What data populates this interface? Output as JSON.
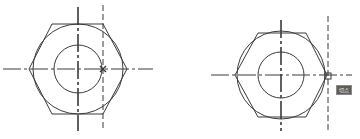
{
  "colors": {
    "line": "#3a3a3a",
    "background": "#ffffff",
    "tooltip_bg": "#5c5c5c"
  },
  "views": [
    {
      "id": "left",
      "center": [
        78,
        69
      ],
      "hexagon_points": "29,69 52,24 103,24 127,69 103,114 52,114",
      "outer_circle_r": 45,
      "inner_circle_r": 24,
      "h_centerline": [
        3,
        153
      ],
      "v_centerline": [
        7,
        131
      ],
      "aux_dashed_line_x": 103,
      "aux_dashed_line_y": [
        5,
        131
      ],
      "snap_marker": {
        "type": "x-marker",
        "at": [
          103,
          69
        ]
      }
    },
    {
      "id": "right",
      "center": [
        281,
        75
      ],
      "hexagon_points": "235,75 258,33 306,33 327,75 306,117 258,117",
      "outer_circle_r": 44,
      "inner_circle_r": 23,
      "h_centerline": [
        211,
        352
      ],
      "v_centerline": [
        20,
        131
      ],
      "aux_dashed_line_x": 328,
      "aux_dashed_line_y": [
        16,
        131
      ],
      "snap_marker": {
        "type": "square-marker",
        "at": [
          328,
          76
        ]
      }
    }
  ],
  "tooltip": {
    "label": "切点"
  }
}
